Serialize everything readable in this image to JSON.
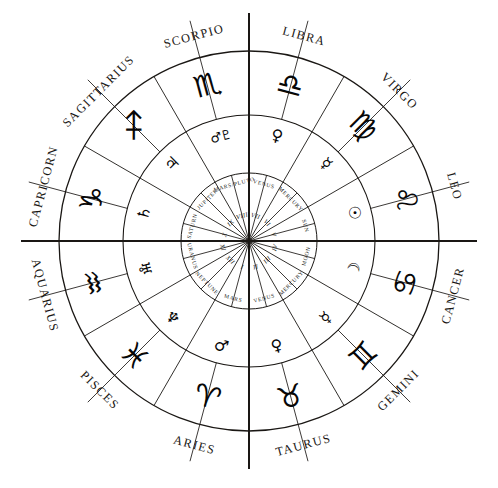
{
  "chart_data": {
    "type": "pie",
    "legend_position": "none",
    "grid": false,
    "categories": [
      "Aries",
      "Taurus",
      "Gemini",
      "Cancer",
      "Leo",
      "Virgo",
      "Libra",
      "Scorpio",
      "Sagittarius",
      "Capricorn",
      "Aquarius",
      "Pisces"
    ],
    "values": [
      30,
      30,
      30,
      30,
      30,
      30,
      30,
      30,
      30,
      30,
      30,
      30
    ],
    "xlabel": "",
    "ylabel": "",
    "note": "Twelve equal 30-degree sectors; three concentric rings: outer sign names, middle sign glyphs, inner planetary rulers with Roman numeral houses I-XII"
  },
  "wheel": {
    "center": {
      "x": 249,
      "y": 241
    },
    "radii": {
      "outer": 190,
      "middle": 126,
      "inner": 68,
      "axis_extent": 228
    },
    "colors": {
      "line": "#1a1714",
      "axis": "#15130f",
      "background": "#ffffff",
      "glyph": "#070707"
    },
    "sectors": [
      {
        "sign": "CAPRICORN",
        "sign_glyph": "♑",
        "planet": "SATURN",
        "planet_glyph": "♄",
        "house": "X",
        "sign_angle_deg": -75,
        "glyph_angle_deg": -75,
        "planet_angle_deg": -75,
        "house_angle_deg": -75
      },
      {
        "sign": "SAGITTARIUS",
        "sign_glyph": "♐",
        "planet": "JUPITER",
        "planet_glyph": "♃",
        "house": "IX",
        "sign_angle_deg": -45,
        "glyph_angle_deg": -45,
        "planet_angle_deg": -45,
        "house_angle_deg": -45
      },
      {
        "sign": "SCORPIO",
        "sign_glyph": "♏",
        "planet": "MARS/PLUTO",
        "planet_glyph": "♂♇",
        "house": "VIII",
        "sign_angle_deg": -15,
        "glyph_angle_deg": -15,
        "planet_angle_deg": -15,
        "house_angle_deg": -15
      },
      {
        "sign": "LIBRA",
        "sign_glyph": "♎",
        "planet": "VENUS",
        "planet_glyph": "♀",
        "house": "VII",
        "sign_angle_deg": 15,
        "glyph_angle_deg": 15,
        "planet_angle_deg": 15,
        "house_angle_deg": 15
      },
      {
        "sign": "VIRGO",
        "sign_glyph": "♍",
        "planet": "MERCURY",
        "planet_glyph": "☿",
        "house": "VI",
        "sign_angle_deg": 45,
        "glyph_angle_deg": 45,
        "planet_angle_deg": 45,
        "house_angle_deg": 45
      },
      {
        "sign": "LEO",
        "sign_glyph": "♌",
        "planet": "SUN",
        "planet_glyph": "☉",
        "house": "V",
        "sign_angle_deg": 75,
        "glyph_angle_deg": 75,
        "planet_angle_deg": 75,
        "house_angle_deg": 75
      },
      {
        "sign": "CANCER",
        "sign_glyph": "♋",
        "planet": "MOON",
        "planet_glyph": "☽",
        "house": "IV",
        "sign_angle_deg": 105,
        "glyph_angle_deg": 105,
        "planet_angle_deg": 105,
        "house_angle_deg": 105
      },
      {
        "sign": "GEMINI",
        "sign_glyph": "♊",
        "planet": "MERCURY",
        "planet_glyph": "☿",
        "house": "III",
        "sign_angle_deg": 135,
        "glyph_angle_deg": 135,
        "planet_angle_deg": 135,
        "house_angle_deg": 135
      },
      {
        "sign": "TAURUS",
        "sign_glyph": "♉",
        "planet": "VENUS",
        "planet_glyph": "♀",
        "house": "II",
        "sign_angle_deg": 165,
        "glyph_angle_deg": 165,
        "planet_angle_deg": 165,
        "house_angle_deg": 165
      },
      {
        "sign": "ARIES",
        "sign_glyph": "♈",
        "planet": "MARS",
        "planet_glyph": "♂",
        "house": "I",
        "sign_angle_deg": 195,
        "glyph_angle_deg": 195,
        "planet_angle_deg": 195,
        "house_angle_deg": 195
      },
      {
        "sign": "PISCES",
        "sign_glyph": "♓",
        "planet": "NEPTUNE",
        "planet_glyph": "♆",
        "house": "XII",
        "sign_angle_deg": 225,
        "glyph_angle_deg": 225,
        "planet_angle_deg": 225,
        "house_angle_deg": 225
      },
      {
        "sign": "AQUARIUS",
        "sign_glyph": "♒",
        "planet": "URANUS",
        "planet_glyph": "♅",
        "house": "XI",
        "sign_angle_deg": 255,
        "glyph_angle_deg": 255,
        "planet_angle_deg": 255,
        "house_angle_deg": 255
      }
    ]
  }
}
